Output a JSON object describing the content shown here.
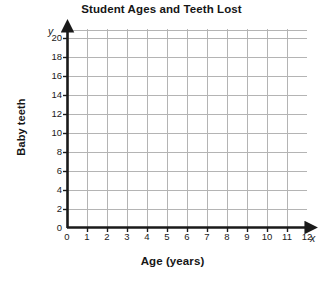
{
  "chart_data": {
    "type": "scatter",
    "title": "Student Ages and Teeth Lost",
    "xlabel": "Age (years)",
    "ylabel": "Baby teeth",
    "x_axis_variable": "x",
    "y_axis_variable": "y",
    "xlim": [
      0,
      12
    ],
    "ylim": [
      0,
      20
    ],
    "x_tick_labels": [
      "0",
      "1",
      "2",
      "3",
      "4",
      "5",
      "6",
      "7",
      "8",
      "9",
      "10",
      "11",
      "12"
    ],
    "y_tick_labels": [
      "0",
      "2",
      "4",
      "6",
      "8",
      "10",
      "12",
      "14",
      "16",
      "18",
      "20"
    ],
    "x_ticks": [
      0,
      1,
      2,
      3,
      4,
      5,
      6,
      7,
      8,
      9,
      10,
      11,
      12
    ],
    "y_ticks": [
      0,
      2,
      4,
      6,
      8,
      10,
      12,
      14,
      16,
      18,
      20
    ],
    "grid": true,
    "legend": "none",
    "series": [],
    "values": [],
    "annotations": [],
    "note": "Empty coordinate grid - no data points plotted"
  },
  "style": {
    "grid_color": "#b4b4b4",
    "axis_color": "#1a1a1a",
    "text_color": "#1a1a1a",
    "background": "#ffffff"
  }
}
